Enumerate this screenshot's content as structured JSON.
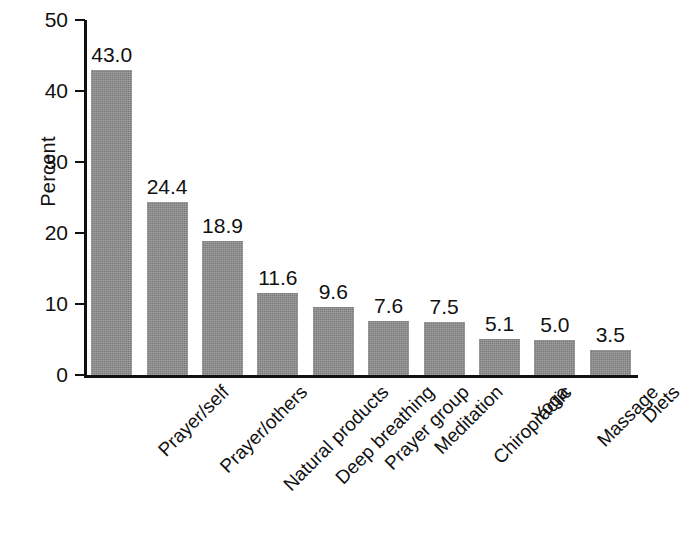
{
  "chart_data": {
    "type": "bar",
    "title": "",
    "xlabel": "",
    "ylabel": "Percent",
    "ylim": [
      0,
      50
    ],
    "yticks": [
      0,
      10,
      20,
      30,
      40,
      50
    ],
    "ytick_labels": [
      "0",
      "10",
      "20",
      "30",
      "40",
      "50"
    ],
    "grid": false,
    "legend": "none",
    "bar_color": "#8a8a8a",
    "axis_color": "#111111",
    "categories": [
      "Prayer/self",
      "Prayer/others",
      "Natural products",
      "Deep breathing",
      "Prayer group",
      "Meditation",
      "Chiropractic",
      "Yoga",
      "Massage",
      "Diets"
    ],
    "values": [
      43.0,
      24.4,
      18.9,
      11.6,
      9.6,
      7.6,
      7.5,
      5.1,
      5.0,
      3.5
    ],
    "value_labels": [
      "43.0",
      "24.4",
      "18.9",
      "11.6",
      "9.6",
      "7.6",
      "7.5",
      "5.1",
      "5.0",
      "3.5"
    ]
  }
}
